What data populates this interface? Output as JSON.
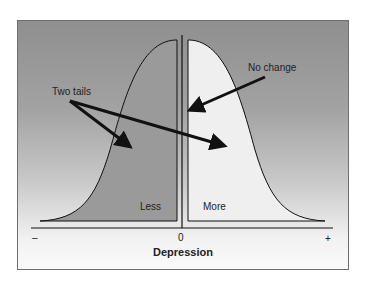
{
  "diagram": {
    "annotations": {
      "two_tails": "Two tails",
      "no_change": "No change"
    },
    "regions": {
      "left": "Less",
      "right": "More"
    },
    "axis": {
      "min_label": "–",
      "center_label": "0",
      "max_label": "+",
      "title": "Depression"
    },
    "colors": {
      "left_fill": "#9a9a9a",
      "right_fill": "#efefef",
      "stroke": "#111111"
    }
  }
}
